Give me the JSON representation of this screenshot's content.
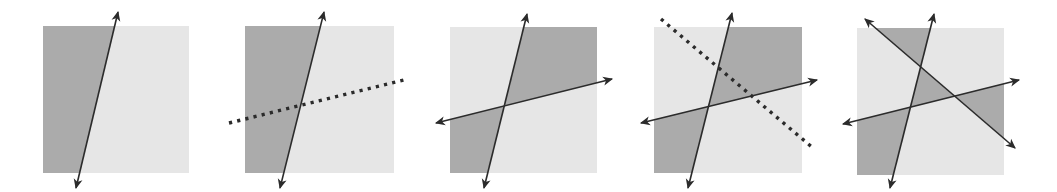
{
  "figure": {
    "colors": {
      "background": "#ffffff",
      "dark_region": "#ababab",
      "light_region": "#e6e6e6",
      "line": "#2b2b2b"
    },
    "panels": [
      {
        "id": 1,
        "square": {
          "x": 43,
          "y": 26,
          "w": 146,
          "h": 147
        },
        "solid_lines": [
          {
            "x1": 118,
            "y1": 12,
            "x2": 76,
            "y2": 188,
            "arrows": true
          }
        ],
        "dotted_lines": [],
        "note": "one line; left side dark, right side light"
      },
      {
        "id": 2,
        "square": {
          "x": 245,
          "y": 26,
          "w": 149,
          "h": 147
        },
        "solid_lines": [
          {
            "x1": 324,
            "y1": 12,
            "x2": 280,
            "y2": 188,
            "arrows": true
          }
        ],
        "dotted_lines": [
          {
            "x1": 229,
            "y1": 123,
            "x2": 408,
            "y2": 79
          }
        ],
        "note": "same as panel 1 with a new dotted line to be added"
      },
      {
        "id": 3,
        "square": {
          "x": 450,
          "y": 27,
          "w": 147,
          "h": 146
        },
        "solid_lines": [
          {
            "x1": 527,
            "y1": 14,
            "x2": 484,
            "y2": 188,
            "arrows": true
          },
          {
            "x1": 436,
            "y1": 123,
            "x2": 612,
            "y2": 79,
            "arrows": true
          }
        ],
        "dotted_lines": [],
        "note": "colors flipped on one side of the new line; two dark quadrants"
      },
      {
        "id": 4,
        "square": {
          "x": 654,
          "y": 27,
          "w": 148,
          "h": 146
        },
        "solid_lines": [
          {
            "x1": 732,
            "y1": 13,
            "x2": 688,
            "y2": 188,
            "arrows": true
          },
          {
            "x1": 641,
            "y1": 123,
            "x2": 817,
            "y2": 80,
            "arrows": true
          }
        ],
        "dotted_lines": [
          {
            "x1": 661,
            "y1": 19,
            "x2": 813,
            "y2": 148
          }
        ],
        "note": "same as panel 3 with a new dotted diagonal line to be added"
      },
      {
        "id": 5,
        "square": {
          "x": 857,
          "y": 28,
          "w": 147,
          "h": 147
        },
        "solid_lines": [
          {
            "x1": 934,
            "y1": 14,
            "x2": 890,
            "y2": 188,
            "arrows": true
          },
          {
            "x1": 843,
            "y1": 124,
            "x2": 1019,
            "y2": 80,
            "arrows": true
          },
          {
            "x1": 865,
            "y1": 19,
            "x2": 1015,
            "y2": 148,
            "arrows": true
          }
        ],
        "dotted_lines": [],
        "note": "three lines; two-coloring of all regions"
      }
    ]
  }
}
